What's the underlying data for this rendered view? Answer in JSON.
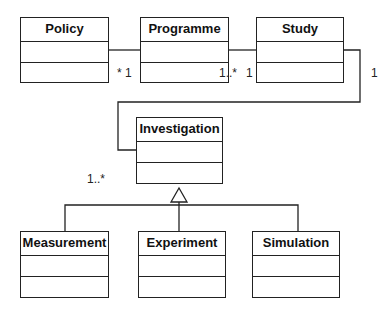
{
  "diagram": {
    "type": "UML class diagram",
    "classes": [
      {
        "id": "policy",
        "name": "Policy"
      },
      {
        "id": "programme",
        "name": "Programme"
      },
      {
        "id": "study",
        "name": "Study"
      },
      {
        "id": "investigation",
        "name": "Investigation"
      },
      {
        "id": "measurement",
        "name": "Measurement"
      },
      {
        "id": "experiment",
        "name": "Experiment"
      },
      {
        "id": "simulation",
        "name": "Simulation"
      }
    ],
    "associations": [
      {
        "from": "Policy",
        "to": "Programme",
        "label": "* 1"
      },
      {
        "from": "Programme",
        "to": "Study",
        "label_programme": "1..*",
        "label_study": "1"
      },
      {
        "from": "Study",
        "to": "Investigation",
        "label_study": "1",
        "label_investigation": "1..*"
      }
    ],
    "generalizations": [
      {
        "parent": "Investigation",
        "children": [
          "Measurement",
          "Experiment",
          "Simulation"
        ]
      }
    ]
  },
  "multiplicities": {
    "policy_programme": "* 1",
    "programme_side": "1..*",
    "study_side": "1",
    "study_right": "1",
    "investigation_side": "1..*"
  },
  "colors": {
    "line": "#222222",
    "background": "#ffffff",
    "text": "#111111"
  }
}
